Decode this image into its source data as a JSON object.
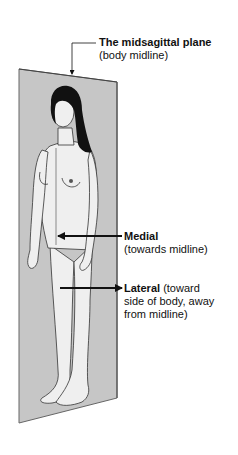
{
  "diagram": {
    "plane": {
      "title": "The midsagittal plane",
      "subtitle": "(body midline)",
      "fill_color": "#c6c6c6",
      "edge_color": "#555555"
    },
    "medial": {
      "term": "Medial",
      "description": "(towards midline)",
      "arrow_direction": "left"
    },
    "lateral": {
      "term": "Lateral",
      "description_line1": " (toward",
      "description_line2": "side of body, away",
      "description_line3": "from midline)",
      "arrow_direction": "right"
    },
    "figure": {
      "subject": "standing female anatomical figure, front view",
      "hair_color": "#111111",
      "skin_color": "#efefef"
    }
  }
}
